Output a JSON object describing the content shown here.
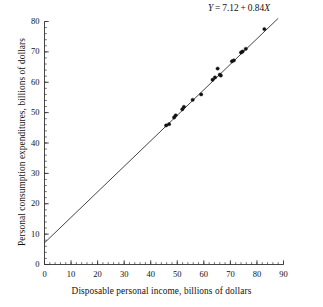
{
  "chart_data": {
    "type": "scatter",
    "title": "",
    "xlabel": "Disposable personal income, billions of dollars",
    "ylabel": "Personal consumption expenditures, billions of dollars",
    "annotation": "Y = 7.12 + 0.84X",
    "annotation_parts": {
      "response": "Y",
      "equals": "=",
      "intercept": "7.12",
      "plus": "+",
      "slope": "0.84",
      "predictor": "X"
    },
    "regression": {
      "intercept": 7.12,
      "slope": 0.84,
      "line_x_range": [
        0,
        88
      ]
    },
    "xlim": [
      0,
      90
    ],
    "ylim": [
      0,
      80
    ],
    "xticks": [
      0,
      10,
      20,
      30,
      40,
      50,
      60,
      70,
      80,
      90
    ],
    "yticks": [
      0,
      10,
      20,
      30,
      40,
      50,
      60,
      70,
      80
    ],
    "xtick_labels": [
      "0",
      "10",
      "20",
      "30",
      "40",
      "50",
      "60",
      "70",
      "80",
      "90"
    ],
    "ytick_labels": [
      "0",
      "10",
      "20",
      "30",
      "40",
      "50",
      "60",
      "70",
      "80"
    ],
    "x_minor_tick_step": 2,
    "y_minor_tick_step": 2,
    "grid": false,
    "legend": "none",
    "marker": "filled-circle",
    "marker_color": "#111111",
    "line_color": "#222222",
    "axis_color": "#333333",
    "points": [
      {
        "x": 45.8,
        "y": 45.8
      },
      {
        "x": 46.9,
        "y": 46.2
      },
      {
        "x": 48.8,
        "y": 48.4
      },
      {
        "x": 49.4,
        "y": 49.1
      },
      {
        "x": 51.9,
        "y": 51.1
      },
      {
        "x": 52.5,
        "y": 51.9
      },
      {
        "x": 55.8,
        "y": 54.2
      },
      {
        "x": 59.0,
        "y": 56.0
      },
      {
        "x": 63.3,
        "y": 60.8
      },
      {
        "x": 64.2,
        "y": 61.6
      },
      {
        "x": 65.2,
        "y": 64.5
      },
      {
        "x": 66.0,
        "y": 62.5
      },
      {
        "x": 66.4,
        "y": 62.2
      },
      {
        "x": 70.6,
        "y": 66.9
      },
      {
        "x": 71.3,
        "y": 67.2
      },
      {
        "x": 74.0,
        "y": 69.8
      },
      {
        "x": 74.6,
        "y": 70.1
      },
      {
        "x": 75.8,
        "y": 71.0
      },
      {
        "x": 82.8,
        "y": 77.5
      }
    ]
  }
}
